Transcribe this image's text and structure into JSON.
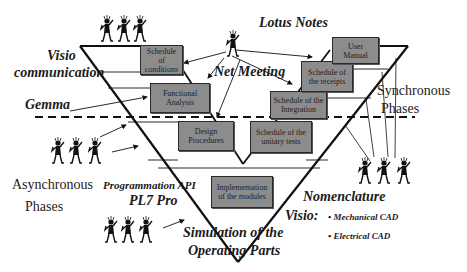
{
  "diagram": {
    "type": "V-cycle",
    "colors": {
      "box_fill": "#8c8c8c",
      "line": "#111111",
      "text": "#1a1a1a"
    },
    "tools": {
      "lotus_notes": "Lotus Notes",
      "visio_communication_1": "Visio",
      "visio_communication_2": "communication",
      "net_meeting": "Net Meeting",
      "gemma": "Gemma",
      "programmation_api": "Programmation API",
      "pl7_pro": "PL7 Pro",
      "simulation_1": "Simulation of the",
      "simulation_2": "Operating Parts",
      "nomenclature": "Nomenclature",
      "visio": "Visio:",
      "visio_items": [
        "• Mechanical CAD",
        "• Electrical CAD"
      ]
    },
    "phases": {
      "synchronous_1": "Synchronous",
      "synchronous_2": "Phases",
      "asynchronous_1": "Asynchronous",
      "asynchronous_2": "Phases"
    },
    "boxes": {
      "schedule_conditions": [
        "Schedule of",
        "conditions"
      ],
      "functional_analysis": [
        "Functional",
        "Analysis"
      ],
      "design_procedures": [
        "Design",
        "Procedures"
      ],
      "implementation": [
        "Implementation",
        "of the modules"
      ],
      "unitary_tests": [
        "Schedule of the",
        "unitary tests"
      ],
      "integration": [
        "Schedule of the",
        "Integration"
      ],
      "receipts": [
        "Schedule of",
        "the receipts"
      ],
      "user_manual": [
        "User",
        "Manual"
      ]
    },
    "people_groups": [
      {
        "name": "top-left-team",
        "count": 3
      },
      {
        "name": "net-meeting-person",
        "count": 1
      },
      {
        "name": "asynchronous-team",
        "count": 3
      },
      {
        "name": "simulation-team",
        "count": 3
      },
      {
        "name": "nomenclature-team",
        "count": 3
      }
    ]
  }
}
